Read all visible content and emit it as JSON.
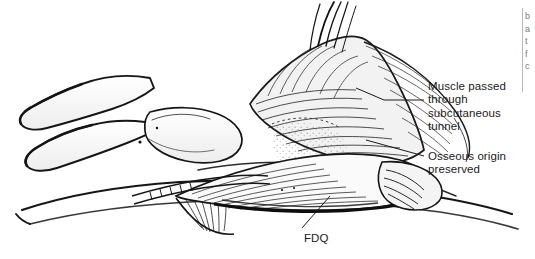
{
  "figure": {
    "kind": "anatomical-line-drawing",
    "background_color": "#ffffff",
    "ink_color": "#1a1a1a",
    "width": 535,
    "height": 259
  },
  "annotations": [
    {
      "id": "muscle-passed",
      "text": "Muscle passed\nthrough\nsubcutaneous\ntunnel",
      "x": 428,
      "y": 80
    },
    {
      "id": "osseous-origin",
      "text": "Osseous origin\npreserved",
      "x": 428,
      "y": 150
    },
    {
      "id": "fdq",
      "text": "FDQ",
      "x": 304,
      "y": 232
    }
  ],
  "right_edge": {
    "fragment_text": "b\na\nt\nf\nc",
    "rule_color": "#b8b8b8"
  }
}
